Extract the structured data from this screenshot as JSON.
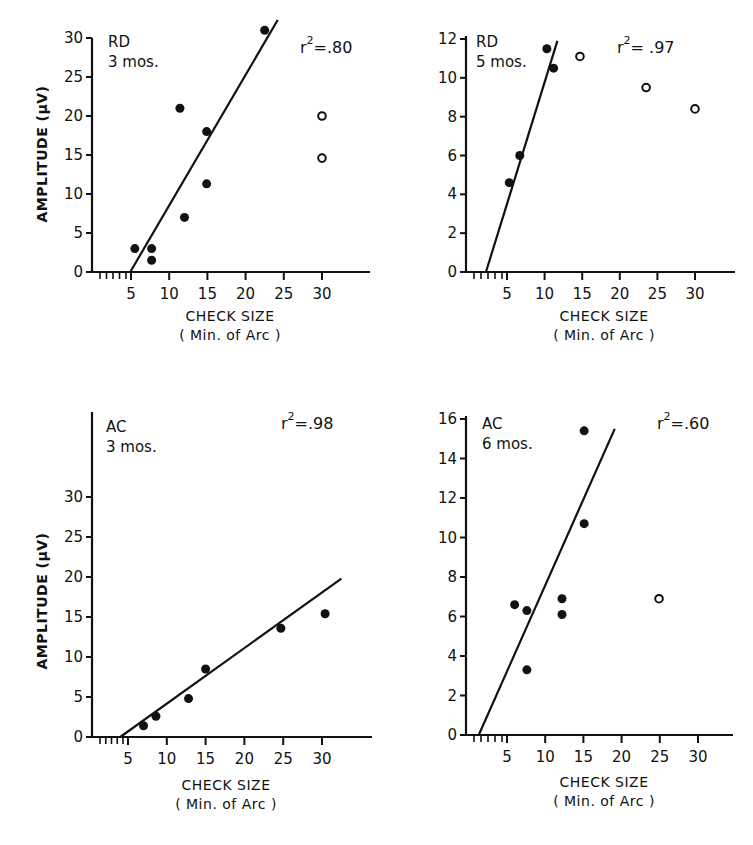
{
  "figure": {
    "panels": [
      {
        "subject": "RD",
        "age": "3 mos.",
        "r2_label": "r",
        "r2_exp": "2",
        "r2_value": "=.80",
        "ylabel": "AMPLITUDE (μV)",
        "xlabel_line1": "CHECK SIZE",
        "xlabel_line2": "( Min. of Arc )"
      },
      {
        "subject": "RD",
        "age": "5 mos.",
        "r2_label": "r",
        "r2_exp": "2",
        "r2_value": "= .97",
        "ylabel": "",
        "xlabel_line1": "CHECK SIZE",
        "xlabel_line2": "( Min. of Arc )"
      },
      {
        "subject": "AC",
        "age": "3 mos.",
        "r2_label": "r",
        "r2_exp": "2",
        "r2_value": "=.98",
        "ylabel": "AMPLITUDE (μV)",
        "xlabel_line1": "CHECK SIZE",
        "xlabel_line2": "( Min. of Arc )"
      },
      {
        "subject": "AC",
        "age": "6 mos.",
        "r2_label": "r",
        "r2_exp": "2",
        "r2_value": "=.60",
        "ylabel": "",
        "xlabel_line1": "CHECK SIZE",
        "xlabel_line2": "( Min. of Arc )"
      }
    ]
  },
  "chart_data": [
    {
      "type": "scatter",
      "title": "RD 3 mos.",
      "annotation": "r² = .80",
      "xlabel": "CHECK SIZE (Min. of Arc)",
      "ylabel": "AMPLITUDE (μV)",
      "xticks": [
        5,
        10,
        15,
        20,
        25,
        30
      ],
      "yticks": [
        0,
        5,
        10,
        15,
        20,
        25,
        30
      ],
      "xlim": [
        0,
        35
      ],
      "ylim": [
        0,
        30
      ],
      "grid": false,
      "series": [
        {
          "name": "filled (fit)",
          "marker": "filled",
          "points": [
            [
              5.5,
              3
            ],
            [
              7.7,
              3
            ],
            [
              7.7,
              1.5
            ],
            [
              11.4,
              21
            ],
            [
              12,
              7
            ],
            [
              14.9,
              18
            ],
            [
              14.9,
              11.3
            ],
            [
              22.5,
              31
            ]
          ]
        },
        {
          "name": "open (excluded)",
          "marker": "open",
          "points": [
            [
              30,
              20
            ],
            [
              30,
              14.6
            ]
          ]
        }
      ],
      "fit_line": {
        "x": [
          4.9,
          24.2
        ],
        "y": [
          0,
          32.3
        ]
      }
    },
    {
      "type": "scatter",
      "title": "RD 5 mos.",
      "annotation": "r² = .97",
      "xlabel": "CHECK SIZE (Min. of Arc)",
      "ylabel": "",
      "xticks": [
        5,
        10,
        15,
        20,
        25,
        30
      ],
      "yticks": [
        0,
        2,
        4,
        6,
        8,
        10,
        12
      ],
      "xlim": [
        0,
        35
      ],
      "ylim": [
        0,
        12
      ],
      "grid": false,
      "series": [
        {
          "name": "filled (fit)",
          "marker": "filled",
          "points": [
            [
              5.3,
              4.6
            ],
            [
              6.7,
              6.0
            ],
            [
              10.3,
              11.5
            ],
            [
              11.2,
              10.5
            ]
          ]
        },
        {
          "name": "open (excluded)",
          "marker": "open",
          "points": [
            [
              14.7,
              11.1
            ],
            [
              23.5,
              9.5
            ],
            [
              30,
              8.4
            ]
          ]
        }
      ],
      "fit_line": {
        "x": [
          2.2,
          11.7
        ],
        "y": [
          0,
          11.9
        ]
      }
    },
    {
      "type": "scatter",
      "title": "AC 3 mos.",
      "annotation": "r² = .98",
      "xlabel": "CHECK SIZE (Min. of Arc)",
      "ylabel": "AMPLITUDE (μV)",
      "xticks": [
        5,
        10,
        15,
        20,
        25,
        30
      ],
      "yticks": [
        0,
        5,
        10,
        15,
        20,
        25,
        30
      ],
      "xlim": [
        0,
        35
      ],
      "ylim": [
        0,
        30
      ],
      "grid": false,
      "series": [
        {
          "name": "filled (fit)",
          "marker": "filled",
          "points": [
            [
              7,
              1.4
            ],
            [
              8.6,
              2.6
            ],
            [
              12.8,
              4.8
            ],
            [
              15,
              8.5
            ],
            [
              24.7,
              13.6
            ],
            [
              30.4,
              15.4
            ]
          ]
        }
      ],
      "fit_line": {
        "x": [
          4,
          32.5
        ],
        "y": [
          0,
          19.8
        ]
      }
    },
    {
      "type": "scatter",
      "title": "AC 6 mos.",
      "annotation": "r² = .60",
      "xlabel": "CHECK SIZE (Min. of Arc)",
      "ylabel": "",
      "xticks": [
        5,
        10,
        15,
        20,
        25,
        30
      ],
      "yticks": [
        0,
        2,
        4,
        6,
        8,
        10,
        12,
        14,
        16
      ],
      "xlim": [
        0,
        35
      ],
      "ylim": [
        0,
        16
      ],
      "grid": false,
      "series": [
        {
          "name": "filled (fit)",
          "marker": "filled",
          "points": [
            [
              6,
              6.6
            ],
            [
              7.6,
              6.3
            ],
            [
              7.6,
              3.3
            ],
            [
              12.2,
              6.9
            ],
            [
              12.2,
              6.1
            ],
            [
              15.1,
              15.4
            ],
            [
              15.1,
              10.7
            ]
          ]
        },
        {
          "name": "open (excluded)",
          "marker": "open",
          "points": [
            [
              24.9,
              6.9
            ]
          ]
        }
      ],
      "fit_line": {
        "x": [
          1.3,
          19.1
        ],
        "y": [
          0,
          15.5
        ]
      }
    }
  ]
}
